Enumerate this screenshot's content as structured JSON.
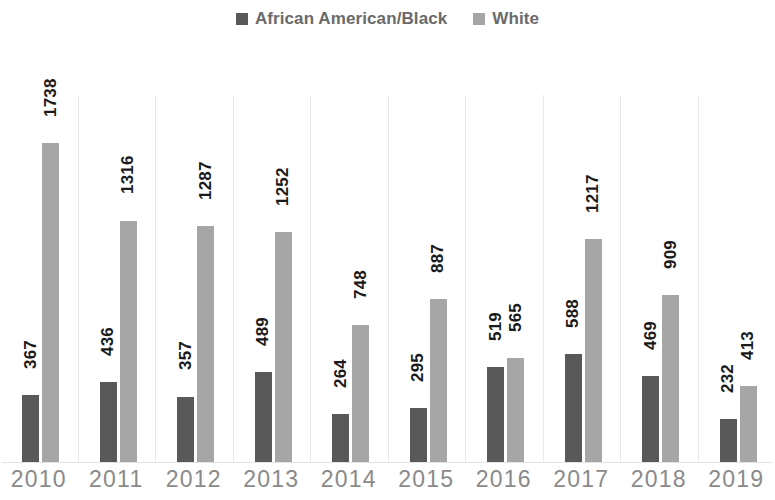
{
  "chart_data": {
    "type": "bar",
    "title": "",
    "subtitle": "",
    "xlabel": "",
    "ylabel": "",
    "grid": false,
    "legend_position": "top-center",
    "ylim": [
      0,
      1738
    ],
    "categories": [
      "2010",
      "2011",
      "2012",
      "2013",
      "2014",
      "2015",
      "2016",
      "2017",
      "2018",
      "2019"
    ],
    "series": [
      {
        "name": "African American/Black",
        "color": "#595959",
        "values": [
          367,
          436,
          357,
          489,
          264,
          295,
          519,
          588,
          469,
          232
        ]
      },
      {
        "name": "White",
        "color": "#a6a6a6",
        "values": [
          1738,
          1316,
          1287,
          1252,
          748,
          887,
          565,
          1217,
          909,
          413
        ]
      }
    ]
  },
  "legend": {
    "entries": [
      {
        "label": "African American/Black",
        "marker": "square-swatch-dark",
        "color": "#595959"
      },
      {
        "label": "White",
        "marker": "square-swatch-light",
        "color": "#a6a6a6"
      }
    ]
  },
  "axis": {
    "x_tick_labels": [
      "2010",
      "2011",
      "2012",
      "2013",
      "2014",
      "2015",
      "2016",
      "2017",
      "2018",
      "2019"
    ]
  }
}
